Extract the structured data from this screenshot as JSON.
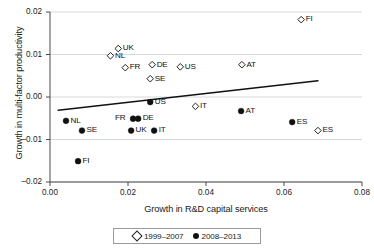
{
  "chart_data": {
    "type": "scatter",
    "title": "",
    "xlabel": "Growth in R&D capital services",
    "ylabel": "Growth in multi-factor productivity",
    "xlim": [
      0.0,
      0.08
    ],
    "ylim": [
      -0.02,
      0.02
    ],
    "xticks": [
      "0.00",
      "0.02",
      "0.04",
      "0.06",
      "0.08"
    ],
    "xtick_values": [
      0.0,
      0.02,
      0.04,
      0.06,
      0.08
    ],
    "yticks": [
      "0.02",
      "0.01",
      "0.00",
      "–0.01",
      "–0.02"
    ],
    "ytick_values": [
      0.02,
      0.01,
      0.0,
      -0.01,
      -0.02
    ],
    "grid": "horizontal",
    "legend_position": "below-axis-center",
    "series": [
      {
        "name": "1999–2007",
        "marker": "open-diamond",
        "color": "#ffffff",
        "edge_color": "#222222",
        "points": [
          {
            "label": "UK",
            "x": 0.0175,
            "y": 0.0114,
            "label_pos": "right"
          },
          {
            "label": "NL",
            "x": 0.0155,
            "y": 0.0097,
            "label_pos": "right"
          },
          {
            "label": "FR",
            "x": 0.0193,
            "y": 0.0069,
            "label_pos": "right"
          },
          {
            "label": "DE",
            "x": 0.0262,
            "y": 0.0076,
            "label_pos": "right"
          },
          {
            "label": "SE",
            "x": 0.0257,
            "y": 0.0043,
            "label_pos": "right"
          },
          {
            "label": "US",
            "x": 0.0334,
            "y": 0.0071,
            "label_pos": "right"
          },
          {
            "label": "AT",
            "x": 0.0492,
            "y": 0.0076,
            "label_pos": "right"
          },
          {
            "label": "FI",
            "x": 0.0644,
            "y": 0.0182,
            "label_pos": "right"
          },
          {
            "label": "IT",
            "x": 0.0373,
            "y": -0.0022,
            "label_pos": "right"
          },
          {
            "label": "ES",
            "x": 0.0687,
            "y": -0.0079,
            "label_pos": "right"
          }
        ]
      },
      {
        "name": "2008–2013",
        "marker": "filled-circle",
        "color": "#111111",
        "edge_color": "#111111",
        "points": [
          {
            "label": "NL",
            "x": 0.0041,
            "y": -0.0056,
            "label_pos": "right"
          },
          {
            "label": "SE",
            "x": 0.0082,
            "y": -0.0079,
            "label_pos": "right"
          },
          {
            "label": "FI",
            "x": 0.0072,
            "y": -0.0151,
            "label_pos": "right"
          },
          {
            "label": "FR",
            "x": 0.0213,
            "y": -0.0051,
            "label_pos": "left"
          },
          {
            "label": "DE",
            "x": 0.0226,
            "y": -0.0051,
            "label_pos": "right"
          },
          {
            "label": "UK",
            "x": 0.0208,
            "y": -0.0079,
            "label_pos": "right"
          },
          {
            "label": "IT",
            "x": 0.0267,
            "y": -0.0079,
            "label_pos": "right"
          },
          {
            "label": "US",
            "x": 0.0257,
            "y": -0.0012,
            "label_pos": "right"
          },
          {
            "label": "AT",
            "x": 0.049,
            "y": -0.0033,
            "label_pos": "right"
          },
          {
            "label": "ES",
            "x": 0.0621,
            "y": -0.0059,
            "label_pos": "right"
          }
        ]
      }
    ],
    "trend_line": {
      "x_start": 0.0021,
      "y_start": -0.0031,
      "x_end": 0.0687,
      "y_end": 0.0038,
      "color": "#111111"
    }
  },
  "legend": {
    "items": [
      {
        "symbol": "open-diamond",
        "label": "1999–2007"
      },
      {
        "symbol": "filled-circle",
        "label": "2008–2013"
      }
    ]
  }
}
